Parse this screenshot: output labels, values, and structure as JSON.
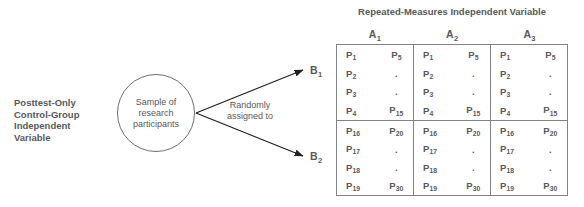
{
  "design_label": {
    "lines": [
      "Posttest-Only",
      "Control-Group",
      "Independent",
      "Variable"
    ]
  },
  "sample_circle": {
    "lines": [
      "Sample of",
      "research",
      "participants"
    ]
  },
  "assignment": {
    "lines": [
      "Randomly",
      "assigned to"
    ]
  },
  "matrix_title": "Repeated-Measures Independent Variable",
  "columns": [
    {
      "label": "A",
      "sub": "1"
    },
    {
      "label": "A",
      "sub": "2"
    },
    {
      "label": "A",
      "sub": "3"
    }
  ],
  "rows": [
    {
      "label": "B",
      "sub": "1"
    },
    {
      "label": "B",
      "sub": "2"
    }
  ],
  "cell_contents": {
    "row1": {
      "left_column": [
        {
          "label": "P",
          "sub": "1"
        },
        {
          "label": "P",
          "sub": "2"
        },
        {
          "label": "P",
          "sub": "3"
        },
        {
          "label": "P",
          "sub": "4"
        }
      ],
      "right_column": [
        {
          "label": "P",
          "sub": "5"
        },
        {
          "label": ".",
          "sub": ""
        },
        {
          "label": ".",
          "sub": ""
        },
        {
          "label": "P",
          "sub": "15"
        }
      ]
    },
    "row2": {
      "left_column": [
        {
          "label": "P",
          "sub": "16"
        },
        {
          "label": "P",
          "sub": "17"
        },
        {
          "label": "P",
          "sub": "18"
        },
        {
          "label": "P",
          "sub": "19"
        }
      ],
      "right_column": [
        {
          "label": "P",
          "sub": "20"
        },
        {
          "label": ".",
          "sub": ""
        },
        {
          "label": ".",
          "sub": ""
        },
        {
          "label": "P",
          "sub": "30"
        }
      ]
    }
  },
  "colors": {
    "text": "#58595b",
    "line": "#808285",
    "circle_border": "#6d6e71",
    "background": "#ffffff"
  }
}
